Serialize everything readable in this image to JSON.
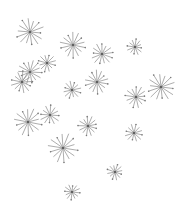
{
  "scene": {
    "description": "Scattered gray starburst / dandelion-seed shapes on white background",
    "background": "#ffffff",
    "star_color": "#8a8a8a",
    "width": 187,
    "height": 210
  },
  "stars": [
    {
      "x": 30,
      "y": 32,
      "r": 14,
      "rays": 14,
      "rot": 5
    },
    {
      "x": 73,
      "y": 45,
      "r": 13,
      "rays": 14,
      "rot": 12
    },
    {
      "x": 102,
      "y": 54,
      "r": 11,
      "rays": 13,
      "rot": 20
    },
    {
      "x": 135,
      "y": 47,
      "r": 8,
      "rays": 12,
      "rot": 8
    },
    {
      "x": 47,
      "y": 63,
      "r": 9,
      "rays": 12,
      "rot": 15
    },
    {
      "x": 30,
      "y": 72,
      "r": 12,
      "rays": 14,
      "rot": 3
    },
    {
      "x": 22,
      "y": 82,
      "r": 11,
      "rays": 13,
      "rot": 25
    },
    {
      "x": 97,
      "y": 82,
      "r": 12,
      "rays": 14,
      "rot": 10
    },
    {
      "x": 72,
      "y": 90,
      "r": 9,
      "rays": 12,
      "rot": 18
    },
    {
      "x": 161,
      "y": 87,
      "r": 14,
      "rays": 14,
      "rot": 7
    },
    {
      "x": 136,
      "y": 97,
      "r": 11,
      "rays": 13,
      "rot": 22
    },
    {
      "x": 28,
      "y": 122,
      "r": 14,
      "rays": 14,
      "rot": 11
    },
    {
      "x": 50,
      "y": 115,
      "r": 10,
      "rays": 12,
      "rot": 4
    },
    {
      "x": 88,
      "y": 126,
      "r": 10,
      "rays": 13,
      "rot": 16
    },
    {
      "x": 63,
      "y": 148,
      "r": 15,
      "rays": 14,
      "rot": 9
    },
    {
      "x": 134,
      "y": 133,
      "r": 9,
      "rays": 12,
      "rot": 13
    },
    {
      "x": 115,
      "y": 172,
      "r": 8,
      "rays": 12,
      "rot": 19
    },
    {
      "x": 72,
      "y": 192,
      "r": 8,
      "rays": 12,
      "rot": 6
    }
  ]
}
